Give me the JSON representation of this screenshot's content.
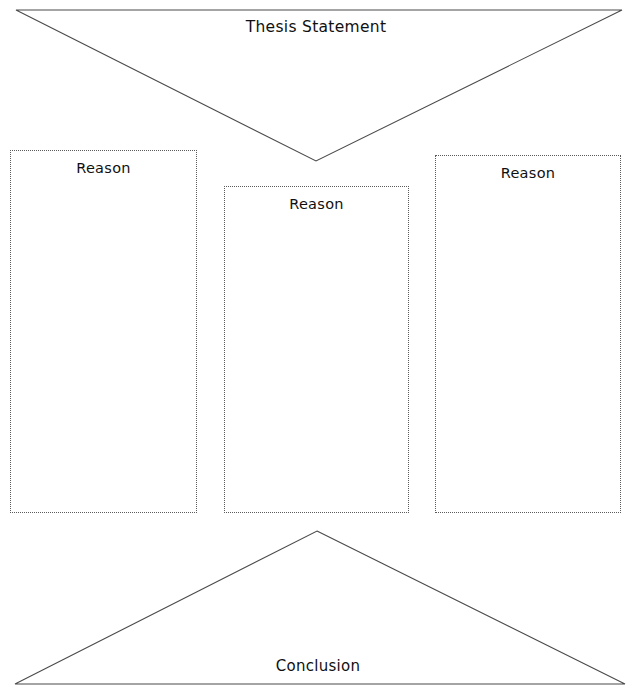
{
  "diagram": {
    "title_shape": {
      "name": "thesis-statement-triangle",
      "label": "Thesis Statement",
      "orientation": "inverted-triangle",
      "stroke_color": "#4a4a4a"
    },
    "conclusion_shape": {
      "name": "conclusion-triangle",
      "label": "Conclusion",
      "orientation": "upright-triangle",
      "stroke_color": "#4a4a4a"
    },
    "reason_boxes": [
      {
        "label": "Reason",
        "position": "left"
      },
      {
        "label": "Reason",
        "position": "middle"
      },
      {
        "label": "Reason",
        "position": "right"
      }
    ],
    "colors": {
      "background": "#ffffff",
      "line": "#4a4a4a",
      "box_border": "#5a5a5a",
      "text": "#101010"
    }
  }
}
